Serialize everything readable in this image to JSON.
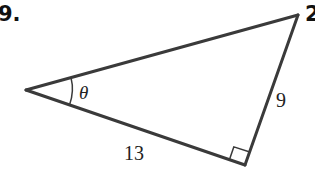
{
  "problem": {
    "number_label": "9.",
    "next_number_label": "2"
  },
  "figure": {
    "type": "right-triangle",
    "stroke_color": "#3a3a3a",
    "vertices": {
      "left": [
        26,
        90
      ],
      "top_right": [
        298,
        15
      ],
      "right_angle": [
        245,
        165
      ]
    },
    "angle_label": "θ",
    "angle_at": "left",
    "right_angle_at": "bottom-right",
    "sides": {
      "adjacent_label": "13",
      "opposite_label": "9"
    }
  }
}
